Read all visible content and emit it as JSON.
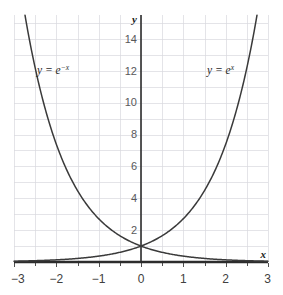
{
  "chart_data": {
    "type": "line",
    "title": "",
    "xlabel": "x",
    "ylabel": "y",
    "xlim": [
      -3,
      3
    ],
    "ylim": [
      0,
      15.5
    ],
    "grid": true,
    "grid_color": "#d9d9de",
    "legend": "inline-curve-labels",
    "x_ticks": [
      -3,
      -2,
      -1,
      0,
      1,
      2,
      3
    ],
    "x_tick_labels": [
      "−3",
      "−2",
      "−1",
      "0",
      "1",
      "2",
      "3"
    ],
    "x_minor_step": 0.5,
    "y_ticks": [
      2,
      4,
      6,
      8,
      10,
      12,
      14
    ],
    "y_tick_labels": [
      "2",
      "4",
      "6",
      "8",
      "10",
      "12",
      "14"
    ],
    "y_minor_step": 1,
    "series": [
      {
        "name": "y = e^x",
        "label_base": "y = e",
        "label_exponent": "x",
        "color": "#3a3a3a",
        "x": [
          -3,
          -2.5,
          -2,
          -1.5,
          -1,
          -0.5,
          0,
          0.5,
          1,
          1.5,
          2,
          2.5,
          2.74
        ],
        "values": [
          0.0498,
          0.0821,
          0.1353,
          0.2231,
          0.3679,
          0.6065,
          1,
          1.6487,
          2.7183,
          4.4817,
          7.3891,
          12.1825,
          15.5
        ]
      },
      {
        "name": "y = e^-x",
        "label_base": "y = e",
        "label_exponent": "−x",
        "color": "#3a3a3a",
        "x": [
          -2.74,
          -2.5,
          -2,
          -1.5,
          -1,
          -0.5,
          0,
          0.5,
          1,
          1.5,
          2,
          2.5,
          3
        ],
        "values": [
          15.5,
          12.1825,
          7.3891,
          4.4817,
          2.7183,
          1.6487,
          1,
          0.6065,
          0.3679,
          0.2231,
          0.1353,
          0.0821,
          0.0498
        ]
      }
    ],
    "annotations": [
      {
        "text": "y = e^-x",
        "x": -2.05,
        "y": 12.2
      },
      {
        "text": "y = e^x",
        "x": 1.45,
        "y": 12.2
      }
    ],
    "axis_labels": {
      "y_axis": "y",
      "x_axis": "x"
    }
  }
}
